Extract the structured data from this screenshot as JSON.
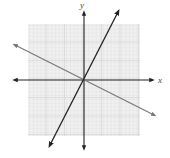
{
  "figure": {
    "type": "coordinate-plane",
    "axes": {
      "x_label": "x",
      "y_label": "y"
    },
    "grid": {
      "visible": true,
      "color": "#d9d9d9",
      "major_color": "#c4c4c4",
      "background": "#efefef"
    },
    "lines": [
      {
        "name": "steep-line",
        "color": "#222222",
        "description": "positive slope through origin",
        "slope_approx": 2
      },
      {
        "name": "shallow-line",
        "color": "#777777",
        "description": "negative slope through origin",
        "slope_approx": -0.5
      }
    ]
  }
}
